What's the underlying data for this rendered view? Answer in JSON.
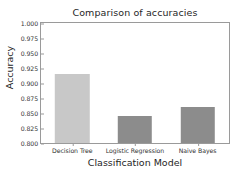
{
  "chart_data": {
    "type": "bar",
    "title": "Comparison of accuracies",
    "xlabel": "Classification Model",
    "ylabel": "Accuracy",
    "categories": [
      "Decision Tree",
      "Logistic Regression",
      "Naive Bayes"
    ],
    "values": [
      0.915,
      0.845,
      0.86
    ],
    "colors": [
      "#c8c8c8",
      "#8c8c8c",
      "#8c8c8c"
    ],
    "ylim": [
      0.8,
      1.0
    ],
    "yticks": [
      0.8,
      0.825,
      0.85,
      0.875,
      0.9,
      0.925,
      0.95,
      0.975,
      1.0
    ],
    "ytick_labels": [
      "0.800",
      "0.825",
      "0.850",
      "0.875",
      "0.900",
      "0.925",
      "0.950",
      "0.975",
      "1.000"
    ],
    "grid": false,
    "legend": "none",
    "bar_width": 0.55,
    "axis_color": "#9a9a9a",
    "text_color": "#262626"
  }
}
